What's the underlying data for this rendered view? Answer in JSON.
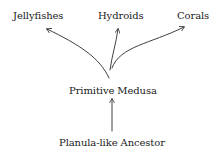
{
  "diagram": {
    "type": "evolutionary-tree",
    "nodes": {
      "ancestor": {
        "label": "Planula-like Ancestor"
      },
      "medusa": {
        "label": "Primitive Medusa"
      },
      "jellyfishes": {
        "label": "Jellyfishes"
      },
      "hydroids": {
        "label": "Hydroids"
      },
      "corals": {
        "label": "Corals"
      }
    },
    "edges": [
      {
        "from": "Planula-like Ancestor",
        "to": "Primitive Medusa"
      },
      {
        "from": "Primitive Medusa",
        "to": "Jellyfishes"
      },
      {
        "from": "Primitive Medusa",
        "to": "Hydroids"
      },
      {
        "from": "Primitive Medusa",
        "to": "Corals"
      }
    ],
    "colors": {
      "text": "#222222",
      "stroke": "#2a2a2a",
      "background": "#ffffff"
    }
  }
}
